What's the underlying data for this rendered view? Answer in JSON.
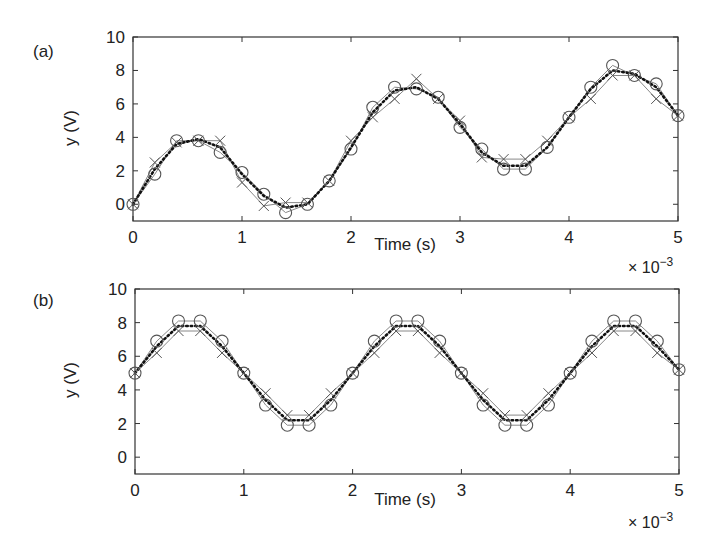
{
  "chart_data": [
    {
      "type": "line",
      "panel_label": "(a)",
      "title": "",
      "xlabel": "Time (s)",
      "ylabel": "y (V)",
      "x_multiplier": "× 10^-3",
      "xlim": [
        0,
        5
      ],
      "ylim": [
        -1,
        10
      ],
      "xticks": [
        "0",
        "1",
        "2",
        "3",
        "4",
        "5"
      ],
      "yticks": [
        "0",
        "2",
        "4",
        "6",
        "8",
        "10"
      ],
      "grid": false,
      "legend": null,
      "x": [
        0,
        0.2,
        0.4,
        0.6,
        0.8,
        1.0,
        1.2,
        1.4,
        1.6,
        1.8,
        2.0,
        2.2,
        2.4,
        2.6,
        2.8,
        3.0,
        3.2,
        3.4,
        3.6,
        3.8,
        4.0,
        4.2,
        4.4,
        4.6,
        4.8,
        5.0
      ],
      "series": [
        {
          "name": "circles (noisy samples)",
          "marker": "o",
          "line": "solid-gray",
          "values": [
            0,
            1.8,
            3.8,
            3.8,
            3.1,
            1.9,
            0.6,
            -0.5,
            0.0,
            1.4,
            3.3,
            5.8,
            7.0,
            6.9,
            6.4,
            4.6,
            3.3,
            2.1,
            2.1,
            3.4,
            5.2,
            7.0,
            8.3,
            7.7,
            7.2,
            5.3
          ]
        },
        {
          "name": "crosses (quantized)",
          "marker": "x",
          "line": "solid-gray",
          "values": [
            0,
            2.5,
            3.7,
            3.8,
            3.8,
            1.3,
            -0.1,
            0.1,
            0.1,
            1.4,
            3.8,
            5.2,
            6.3,
            7.5,
            6.3,
            5.0,
            2.8,
            2.7,
            2.7,
            3.8,
            5.2,
            6.3,
            7.7,
            7.7,
            6.3,
            5.3
          ]
        },
        {
          "name": "dotted (filtered)",
          "marker": "none",
          "line": "dotted-black",
          "values": [
            0,
            2.1,
            3.6,
            3.9,
            3.4,
            1.8,
            0.5,
            -0.2,
            0.0,
            1.4,
            3.4,
            5.5,
            6.8,
            7.0,
            6.3,
            4.8,
            3.1,
            2.3,
            2.3,
            3.4,
            5.2,
            6.9,
            8.0,
            7.8,
            7.0,
            5.3
          ]
        }
      ]
    },
    {
      "type": "line",
      "panel_label": "(b)",
      "title": "",
      "xlabel": "Time (s)",
      "ylabel": "y (V)",
      "x_multiplier": "× 10^-3",
      "xlim": [
        0,
        5
      ],
      "ylim": [
        -1,
        10
      ],
      "xticks": [
        "0",
        "1",
        "2",
        "3",
        "4",
        "5"
      ],
      "yticks": [
        "0",
        "2",
        "4",
        "6",
        "8",
        "10"
      ],
      "grid": false,
      "legend": null,
      "x": [
        0,
        0.2,
        0.4,
        0.6,
        0.8,
        1.0,
        1.2,
        1.4,
        1.6,
        1.8,
        2.0,
        2.2,
        2.4,
        2.6,
        2.8,
        3.0,
        3.2,
        3.4,
        3.6,
        3.8,
        4.0,
        4.2,
        4.4,
        4.6,
        4.8,
        5.0
      ],
      "series": [
        {
          "name": "circles (samples)",
          "marker": "o",
          "line": "solid-gray",
          "values": [
            5,
            6.9,
            8.1,
            8.1,
            6.9,
            5,
            3.1,
            1.9,
            1.9,
            3.1,
            5,
            6.9,
            8.1,
            8.1,
            6.9,
            5,
            3.1,
            1.9,
            1.9,
            3.1,
            5,
            6.9,
            8.1,
            8.1,
            6.9,
            5.2
          ]
        },
        {
          "name": "crosses (quantized)",
          "marker": "x",
          "line": "solid-gray",
          "values": [
            5,
            6.2,
            7.5,
            7.5,
            6.2,
            5,
            3.8,
            2.5,
            2.5,
            3.8,
            5,
            6.2,
            7.5,
            7.5,
            6.2,
            5,
            3.8,
            2.5,
            2.5,
            3.8,
            5,
            6.2,
            7.5,
            7.5,
            6.2,
            5.2
          ]
        },
        {
          "name": "dotted (filtered)",
          "marker": "none",
          "line": "dotted-black",
          "values": [
            5,
            6.6,
            7.8,
            7.8,
            6.6,
            5,
            3.4,
            2.2,
            2.2,
            3.4,
            5,
            6.6,
            7.8,
            7.8,
            6.6,
            5,
            3.4,
            2.2,
            2.2,
            3.4,
            5,
            6.6,
            7.8,
            7.8,
            6.6,
            5.2
          ]
        }
      ]
    }
  ],
  "panels": [
    {
      "label": "(a)",
      "xlabel": "Time (s)",
      "ylabel": "y (V)",
      "mult": "× 10",
      "mult_exp": "−3"
    },
    {
      "label": "(b)",
      "xlabel": "Time (s)",
      "ylabel": "y (V)",
      "mult": "× 10",
      "mult_exp": "−3"
    }
  ],
  "colors": {
    "frame": "#333333",
    "marker": "#555555",
    "line": "#888888",
    "dotted": "#111111"
  }
}
